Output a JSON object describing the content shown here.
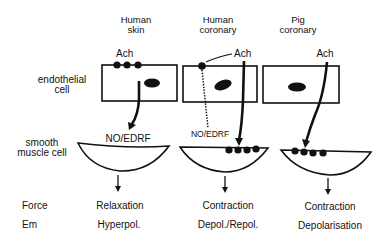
{
  "columns": [
    {
      "title_line1": "Human",
      "title_line2": "skin",
      "agonist": "Ach",
      "mediator": "NO/EDRF",
      "force": "Relaxation",
      "em": "Hyperpol."
    },
    {
      "title_line1": "Human",
      "title_line2": "coronary",
      "agonist": "Ach",
      "mediator": "NO/EDRF",
      "force": "Contraction",
      "em": "Depol./Repol."
    },
    {
      "title_line1": "Pig",
      "title_line2": "coronary",
      "agonist": "Ach",
      "force": "Contraction",
      "em": "Depolarisation"
    }
  ],
  "row_labels": {
    "endothelial_line1": "endothelial",
    "endothelial_line2": "cell",
    "smooth_line1": "smooth",
    "smooth_line2": "muscle cell",
    "force": "Force",
    "em": "Em"
  },
  "colors": {
    "ink": "#111111",
    "background": "#ffffff"
  }
}
